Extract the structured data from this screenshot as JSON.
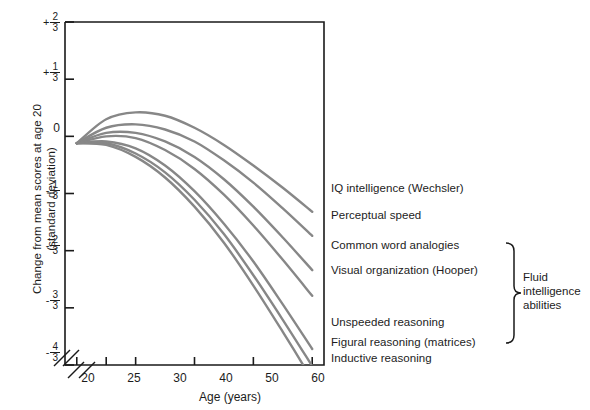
{
  "chart_data": {
    "type": "line",
    "title": "",
    "xlabel": "Age (years)",
    "ylabel": "Change from mean scores at age 20 (standard deviation)",
    "ylabel_line1": "Change from mean scores at age 20",
    "ylabel_line2": "(standard deviation)",
    "xlim": [
      18,
      62
    ],
    "ylim": [
      -1.3333,
      0.6667
    ],
    "grid": false,
    "legend_position": "right-inline",
    "axis_break_x": true,
    "axis_break_y": true,
    "xticks": [
      {
        "value": 20,
        "label": "20"
      },
      {
        "value": 25,
        "label": "25"
      },
      {
        "value": 30,
        "label": "30"
      },
      {
        "value": 40,
        "label": "40"
      },
      {
        "value": 50,
        "label": "50"
      },
      {
        "value": 60,
        "label": "60"
      }
    ],
    "yticks": [
      {
        "value": 0.6667,
        "sign": "+",
        "num": "2",
        "den": "3"
      },
      {
        "value": 0.3333,
        "sign": "+",
        "num": "1",
        "den": "3"
      },
      {
        "value": 0.0,
        "sign": "",
        "num": "0",
        "den": ""
      },
      {
        "value": -0.3333,
        "sign": "-",
        "num": "1",
        "den": "3"
      },
      {
        "value": -0.6667,
        "sign": "-",
        "num": "2",
        "den": "3"
      },
      {
        "value": -1.0,
        "sign": "-",
        "num": "3",
        "den": "3"
      },
      {
        "value": -1.3333,
        "sign": "-",
        "num": "4",
        "den": "3"
      }
    ],
    "line_color": "#878787",
    "x": [
      20,
      25,
      30,
      35,
      40,
      45,
      50,
      55,
      60
    ],
    "series": [
      {
        "name": "IQ intelligence  (Wechsler)",
        "values": [
          -0.04,
          0.1,
          0.14,
          0.12,
          0.05,
          -0.05,
          -0.17,
          -0.3,
          -0.44
        ]
      },
      {
        "name": "Perceptual speed",
        "values": [
          -0.04,
          0.05,
          0.07,
          0.04,
          -0.03,
          -0.14,
          -0.27,
          -0.42,
          -0.58
        ]
      },
      {
        "name": "Common word analogies",
        "values": [
          -0.04,
          0.02,
          0.02,
          -0.03,
          -0.12,
          -0.25,
          -0.41,
          -0.59,
          -0.78
        ]
      },
      {
        "name": "Visual organization  (Hooper)",
        "values": [
          -0.04,
          0.0,
          -0.01,
          -0.08,
          -0.19,
          -0.34,
          -0.52,
          -0.72,
          -0.93
        ]
      },
      {
        "name": "Unspeeded reasoning",
        "values": [
          -0.04,
          -0.03,
          -0.07,
          -0.17,
          -0.32,
          -0.51,
          -0.73,
          -0.98,
          -1.24
        ]
      },
      {
        "name": "Figural reasoning  (matrices)",
        "values": [
          -0.04,
          -0.04,
          -0.1,
          -0.21,
          -0.37,
          -0.57,
          -0.81,
          -1.07,
          -1.34
        ]
      },
      {
        "name": "Inductive reasoning",
        "values": [
          -0.04,
          -0.05,
          -0.12,
          -0.24,
          -0.41,
          -0.62,
          -0.87,
          -1.14,
          -1.42
        ]
      }
    ],
    "group_annotation": {
      "line1": "Fluid",
      "line2": "intelligence",
      "line3": "abilities",
      "members": [
        "Common word analogies",
        "Visual organization  (Hooper)",
        "Unspeeded reasoning",
        "Figural reasoning  (matrices)",
        "Inductive reasoning"
      ]
    }
  }
}
